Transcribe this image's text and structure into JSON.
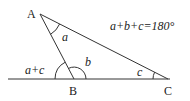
{
  "diagram": {
    "points": {
      "A": {
        "label": "A",
        "x": 40,
        "y": 14
      },
      "B": {
        "label": "B",
        "x": 74,
        "y": 79
      },
      "C": {
        "label": "C",
        "x": 168,
        "y": 79
      }
    },
    "angle_labels": {
      "a": "a",
      "b": "b",
      "c": "c",
      "exterior": "a+c"
    },
    "equation": "a+b+c=180°",
    "colors": {
      "line": "#333333",
      "text": "#222222",
      "background": "#ffffff"
    }
  }
}
